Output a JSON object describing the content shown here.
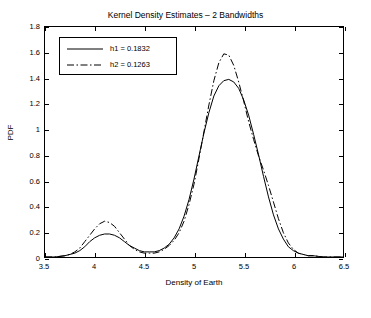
{
  "chart_data": {
    "type": "line",
    "title": "Kernel Density Estimates – 2 Bandwidths",
    "xlabel": "Density of Earth",
    "ylabel": "PDF",
    "xlim": [
      3.5,
      6.5
    ],
    "ylim": [
      0,
      1.8
    ],
    "xticks": [
      "3.5",
      "4",
      "4.5",
      "5",
      "5.5",
      "6",
      "6.5"
    ],
    "yticks": [
      "0",
      "0.2",
      "0.4",
      "0.6",
      "0.8",
      "1",
      "1.2",
      "1.4",
      "1.6",
      "1.8"
    ],
    "grid": false,
    "legend_position": "upper left",
    "series": [
      {
        "name": "h1 = 0.1832",
        "style": "solid",
        "color": "#000000",
        "x": [
          3.5,
          3.6,
          3.7,
          3.8,
          3.85,
          3.9,
          3.95,
          4.0,
          4.05,
          4.1,
          4.15,
          4.2,
          4.25,
          4.3,
          4.35,
          4.4,
          4.45,
          4.5,
          4.55,
          4.6,
          4.65,
          4.7,
          4.75,
          4.8,
          4.85,
          4.9,
          4.95,
          5.0,
          5.05,
          5.1,
          5.15,
          5.2,
          5.25,
          5.3,
          5.35,
          5.4,
          5.45,
          5.5,
          5.55,
          5.6,
          5.65,
          5.7,
          5.75,
          5.8,
          5.85,
          5.9,
          5.95,
          6.0,
          6.05,
          6.1,
          6.15,
          6.2,
          6.3,
          6.4,
          6.5
        ],
        "y": [
          0.0,
          0.0,
          0.01,
          0.03,
          0.05,
          0.08,
          0.12,
          0.15,
          0.17,
          0.18,
          0.18,
          0.17,
          0.15,
          0.12,
          0.09,
          0.07,
          0.05,
          0.04,
          0.04,
          0.04,
          0.05,
          0.07,
          0.1,
          0.15,
          0.22,
          0.32,
          0.45,
          0.61,
          0.79,
          0.97,
          1.13,
          1.26,
          1.34,
          1.38,
          1.39,
          1.37,
          1.32,
          1.23,
          1.11,
          0.96,
          0.8,
          0.63,
          0.47,
          0.33,
          0.22,
          0.14,
          0.08,
          0.05,
          0.03,
          0.02,
          0.01,
          0.01,
          0.0,
          0.0,
          0.0
        ]
      },
      {
        "name": "h2 = 0.1263",
        "style": "dashdot",
        "color": "#000000",
        "x": [
          3.5,
          3.6,
          3.7,
          3.75,
          3.8,
          3.85,
          3.9,
          3.95,
          4.0,
          4.05,
          4.1,
          4.15,
          4.2,
          4.25,
          4.3,
          4.35,
          4.4,
          4.45,
          4.5,
          4.55,
          4.6,
          4.65,
          4.7,
          4.75,
          4.8,
          4.85,
          4.9,
          4.95,
          5.0,
          5.05,
          5.1,
          5.15,
          5.2,
          5.25,
          5.3,
          5.35,
          5.4,
          5.45,
          5.5,
          5.55,
          5.6,
          5.65,
          5.7,
          5.75,
          5.8,
          5.85,
          5.9,
          5.95,
          6.0,
          6.05,
          6.1,
          6.15,
          6.2,
          6.3,
          6.4,
          6.5
        ],
        "y": [
          0.0,
          0.0,
          0.01,
          0.02,
          0.04,
          0.07,
          0.12,
          0.17,
          0.22,
          0.26,
          0.28,
          0.27,
          0.24,
          0.19,
          0.14,
          0.09,
          0.06,
          0.04,
          0.03,
          0.03,
          0.03,
          0.04,
          0.06,
          0.09,
          0.13,
          0.19,
          0.28,
          0.41,
          0.57,
          0.77,
          0.98,
          1.19,
          1.38,
          1.52,
          1.59,
          1.58,
          1.5,
          1.37,
          1.22,
          1.06,
          0.92,
          0.79,
          0.68,
          0.56,
          0.43,
          0.3,
          0.19,
          0.11,
          0.06,
          0.03,
          0.02,
          0.01,
          0.01,
          0.0,
          0.0,
          0.0
        ]
      }
    ]
  }
}
